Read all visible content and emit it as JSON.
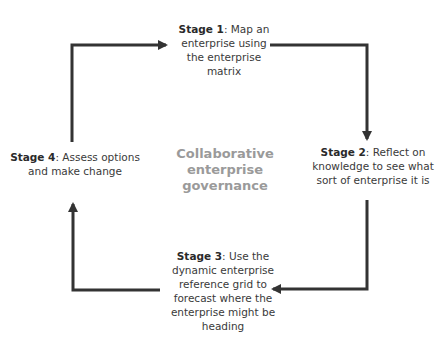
{
  "diagram": {
    "type": "cycle",
    "center_label": [
      "Collaborative",
      "enterprise",
      "governance"
    ],
    "stages": [
      {
        "id": 1,
        "title": "Stage 1",
        "text": ": Map an enterprise using the enterprise matrix",
        "lines": [
          "Map an",
          "enterprise using",
          "the enterprise",
          "matrix"
        ]
      },
      {
        "id": 2,
        "title": "Stage 2",
        "text": ": Reflect on knowledge to see what sort of enterprise it is",
        "lines": [
          "Reflect on",
          "knowledge to see what",
          "sort of enterprise it is"
        ]
      },
      {
        "id": 3,
        "title": "Stage 3",
        "text": ": Use the dynamic enterprise reference grid to forecast where the enterprise might be heading",
        "lines": [
          "Use the",
          "dynamic enterprise",
          "reference grid to",
          "forecast where the",
          "enterprise might be",
          "heading"
        ]
      },
      {
        "id": 4,
        "title": "Stage 4",
        "text": ": Assess options and make change",
        "lines": [
          "Assess options",
          "and make change"
        ]
      }
    ],
    "flow": [
      "Stage 1 -> Stage 2",
      "Stage 2 -> Stage 3",
      "Stage 3 -> Stage 4",
      "Stage 4 -> Stage 1"
    ],
    "colors": {
      "arrow": "#333333",
      "center_text": "#9a9a9a",
      "text": "#3a3a3a"
    }
  }
}
